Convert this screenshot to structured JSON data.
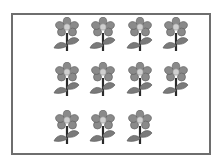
{
  "figure": {
    "rows": [
      {
        "count": 4
      },
      {
        "count": 4
      },
      {
        "count": 3
      }
    ],
    "total_flowers": 11,
    "colors": {
      "border": "#6e6e6e",
      "petal": "#8a8a8a",
      "center": "#cfcfcf",
      "stem": "#2a2a2a",
      "leaf": "#7a7a7a"
    }
  }
}
